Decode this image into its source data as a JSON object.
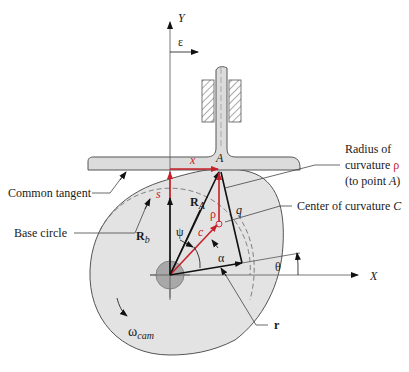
{
  "diagram": {
    "colors": {
      "cam_fill": "#e3e3e3",
      "follower_fill": "#dcdcdc",
      "shaft_fill": "#a8a8a8",
      "outline": "#555555",
      "vector_black": "#111111",
      "vector_red": "#c8202a",
      "leader": "#444444"
    },
    "axes": {
      "y_label": "Y",
      "x_label": "X"
    },
    "offset": {
      "label": "ε"
    },
    "follower": {
      "contact_point_label": "A",
      "x_label": "x",
      "s_label": "s"
    },
    "vectors": {
      "ra_label": "R",
      "ra_sub": "A",
      "rb_label": "R",
      "rb_sub": "b",
      "rho_label": "ρ",
      "q_label": "q",
      "c_label": "c",
      "r_label": "r"
    },
    "angles": {
      "psi": "ψ",
      "alpha": "α",
      "theta": "θ"
    },
    "callouts": {
      "common_tangent": "Common tangent",
      "base_circle": "Base circle",
      "radius_line1": "Radius of",
      "radius_line2_prefix": "curvature ",
      "radius_line2_symbol": "ρ",
      "radius_line3_prefix": "(to point ",
      "radius_line3_point": "A",
      "radius_line3_suffix": ")",
      "center_prefix": "Center of curvature ",
      "center_point": "C",
      "r_callout": "r"
    },
    "rotation": {
      "omega": "ω",
      "omega_sub": "cam"
    }
  }
}
